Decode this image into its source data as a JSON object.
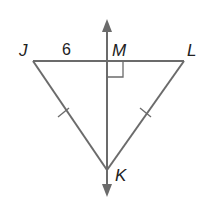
{
  "figure": {
    "type": "geometry",
    "colors": {
      "stroke": "#6b6b6b",
      "text": "#222222",
      "background": "#ffffff"
    },
    "points": {
      "J": {
        "label": "J",
        "x": 33,
        "y": 61
      },
      "L": {
        "label": "L",
        "x": 184,
        "y": 61
      },
      "M": {
        "label": "M",
        "x": 107,
        "y": 61
      },
      "K": {
        "label": "K",
        "x": 107,
        "y": 170
      }
    },
    "segment_labels": {
      "JM": "6"
    },
    "markings": {
      "right_angle_at": "M",
      "congruent_tick_segments": [
        "JK",
        "LK"
      ]
    }
  }
}
